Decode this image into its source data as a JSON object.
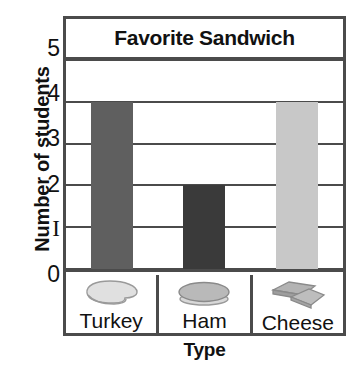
{
  "chart_data": {
    "type": "bar",
    "title": "Favorite Sandwich",
    "xlabel": "Type",
    "ylabel": "Number of students",
    "categories": [
      "Turkey",
      "Ham",
      "Cheese"
    ],
    "values": [
      4,
      2,
      4
    ],
    "ylim": [
      0,
      5
    ],
    "yticks": [
      "0",
      "1",
      "2",
      "3",
      "4",
      "5"
    ],
    "grid": true,
    "legend": "none",
    "bar_colors": [
      "#5f5f5f",
      "#3a3a3a",
      "#c8c8c8"
    ],
    "category_icons": [
      "turkey-slice-icon",
      "ham-slice-icon",
      "cheese-slices-icon"
    ]
  },
  "style": {
    "frame_color": "#4b4b4b",
    "background": "#ffffff",
    "text_color": "#111111"
  }
}
